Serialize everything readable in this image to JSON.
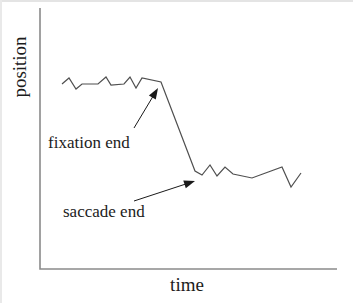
{
  "figure": {
    "width": 353,
    "height": 303,
    "background": "#ffffff",
    "text_color": "#1c1c1c",
    "annotation_color": "#1a1a1a",
    "axis": {
      "color": "#8a8a8a",
      "stroke_width": 1.6,
      "y_label": "position",
      "x_label": "time",
      "origin": [
        40,
        269
      ],
      "y_top": 8,
      "x_right": 337
    },
    "trace": {
      "color": "#4f4f4f",
      "width": 1.2,
      "points": [
        [
          62,
          84
        ],
        [
          69,
          78
        ],
        [
          76,
          89
        ],
        [
          82,
          84
        ],
        [
          98,
          84
        ],
        [
          106,
          77
        ],
        [
          111,
          85
        ],
        [
          124,
          84
        ],
        [
          130,
          77
        ],
        [
          136,
          88
        ],
        [
          142,
          78
        ],
        [
          161,
          82
        ],
        [
          195,
          171
        ],
        [
          202,
          175
        ],
        [
          210,
          165
        ],
        [
          217,
          176
        ],
        [
          225,
          167
        ],
        [
          233,
          174
        ],
        [
          252,
          178
        ],
        [
          282,
          167
        ],
        [
          291,
          187
        ],
        [
          301,
          173
        ]
      ]
    },
    "annotations": [
      {
        "label": "fixation end",
        "text_pos": [
          48,
          148
        ],
        "arrow_from": [
          134,
          128
        ],
        "arrow_to": [
          158,
          88
        ]
      },
      {
        "label": "saccade end",
        "text_pos": [
          63,
          217
        ],
        "arrow_from": [
          134,
          201
        ],
        "arrow_to": [
          195,
          181
        ]
      }
    ]
  },
  "chart_data": {
    "type": "line",
    "title": "",
    "xlabel": "time",
    "ylabel": "position",
    "x_ticks": [],
    "y_ticks": [],
    "grid": false,
    "legend": false,
    "series": [
      {
        "name": "trace",
        "points_px": [
          [
            62,
            84
          ],
          [
            69,
            78
          ],
          [
            76,
            89
          ],
          [
            82,
            84
          ],
          [
            98,
            84
          ],
          [
            106,
            77
          ],
          [
            111,
            85
          ],
          [
            124,
            84
          ],
          [
            130,
            77
          ],
          [
            136,
            88
          ],
          [
            142,
            78
          ],
          [
            161,
            82
          ],
          [
            195,
            171
          ],
          [
            202,
            175
          ],
          [
            210,
            165
          ],
          [
            217,
            176
          ],
          [
            225,
            167
          ],
          [
            233,
            174
          ],
          [
            252,
            178
          ],
          [
            282,
            167
          ],
          [
            291,
            187
          ],
          [
            301,
            173
          ]
        ]
      }
    ],
    "annotations": [
      "fixation end",
      "saccade end"
    ]
  }
}
